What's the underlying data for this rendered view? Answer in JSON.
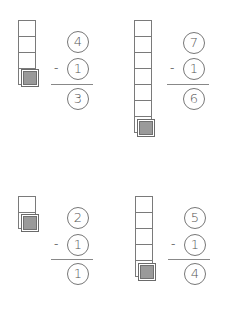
{
  "worksheet": {
    "problems": [
      {
        "minuend": "4",
        "operator": "-",
        "subtrahend": "1",
        "difference": "3",
        "blocks": 4,
        "removed_blocks": 1
      },
      {
        "minuend": "7",
        "operator": "-",
        "subtrahend": "1",
        "difference": "6",
        "blocks": 7,
        "removed_blocks": 1
      },
      {
        "minuend": "2",
        "operator": "-",
        "subtrahend": "1",
        "difference": "1",
        "blocks": 2,
        "removed_blocks": 1
      },
      {
        "minuend": "5",
        "operator": "-",
        "subtrahend": "1",
        "difference": "4",
        "blocks": 5,
        "removed_blocks": 1
      }
    ]
  },
  "colors": {
    "outline": "#7a7a7a",
    "removed_block_fill": "#9a9a9a",
    "background": "#ffffff"
  }
}
